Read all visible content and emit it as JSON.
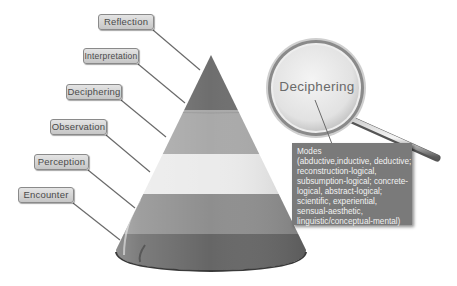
{
  "diagram": {
    "type": "cone-levels",
    "levels_top_to_bottom": [
      {
        "label": "Reflection",
        "band_color": "#6e6e6e"
      },
      {
        "label": "Interpretation",
        "band_color": "#6e6e6e"
      },
      {
        "label": "Deciphering",
        "band_color": "#a8a8a8"
      },
      {
        "label": "Observation",
        "band_color": "#e8e8e8"
      },
      {
        "label": "Perception",
        "band_color": "#8c8c8c"
      },
      {
        "label": "Encounter",
        "band_color": "#6a6a6a"
      }
    ],
    "labels": {
      "reflection": "Reflection",
      "interpretation": "Interpretation",
      "deciphering": "Deciphering",
      "observation": "Observation",
      "perception": "Perception",
      "encounter": "Encounter"
    },
    "magnifier": {
      "title": "Deciphering"
    },
    "modes_box": {
      "lines": [
        "Modes",
        "(abductive,inductive, deductive;",
        "reconstruction-logical,",
        "subsumption-logical; concrete-",
        "logical, abstract-logical;",
        "scientific, experiential,",
        "sensual-aesthetic,",
        "linguistic/conceptual-mental)"
      ]
    }
  }
}
